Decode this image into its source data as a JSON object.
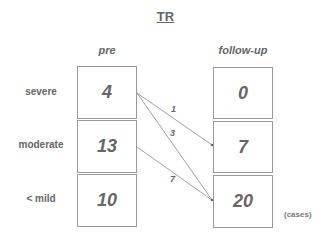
{
  "title": "TR",
  "columns": {
    "pre": "pre",
    "follow_up": "follow-up"
  },
  "rows": [
    "severe",
    "moderate",
    "< mild"
  ],
  "pre_values": [
    "4",
    "13",
    "10"
  ],
  "follow_up_values": [
    "0",
    "7",
    "20"
  ],
  "flows": [
    {
      "from": "severe",
      "to": "moderate",
      "count": "1"
    },
    {
      "from": "severe",
      "to": "< mild",
      "count": "3"
    },
    {
      "from": "moderate",
      "to": "< mild",
      "count": "7"
    }
  ],
  "unit": "(cases)"
}
